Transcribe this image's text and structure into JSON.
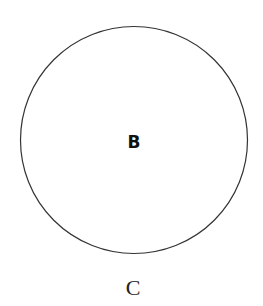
{
  "diagram": {
    "shape": "circle",
    "stroke_color": "#333333",
    "inner_label": "B",
    "caption_label": "C"
  }
}
